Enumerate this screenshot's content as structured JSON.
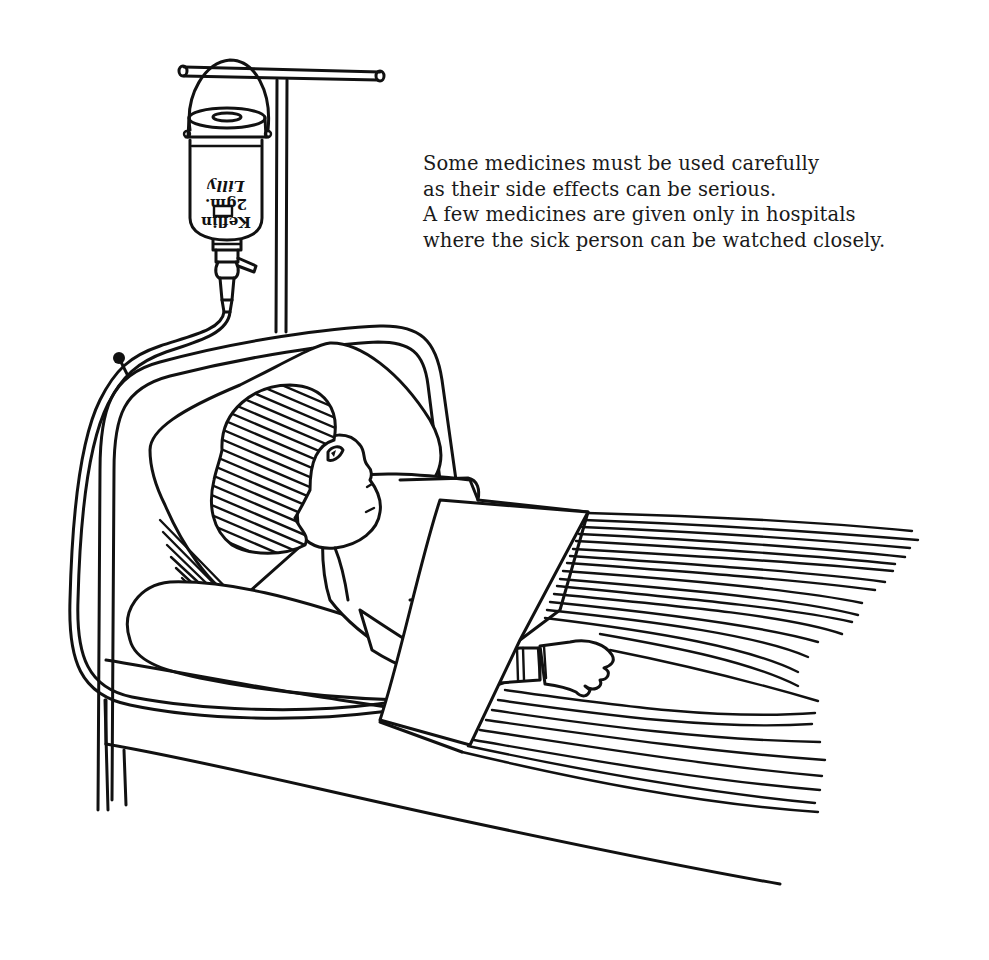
{
  "caption": {
    "lines": [
      "Some medicines must be used carefully",
      "as their side effects can be serious.",
      "A few medicines are given only in hospitals",
      "where the sick person can be watched closely."
    ]
  },
  "illustration": {
    "subject": "patient lying in hospital bed receiving intravenous medicine",
    "iv_bottle_label": {
      "brand_line": "Keflin",
      "dose_line": "2gm.",
      "maker_line": "Lilly",
      "orientation": "upside-down"
    },
    "colors": {
      "ink": "#111111",
      "paper": "#ffffff"
    }
  }
}
